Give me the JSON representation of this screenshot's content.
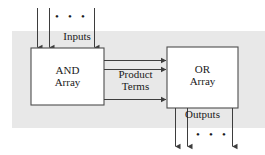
{
  "diagram": {
    "band_color": "#e8e8e8",
    "box_fill": "#ffffff",
    "box_stroke": "#4d4d4d",
    "line_color": "#3d3d3d",
    "text_color": "#1a1a1a",
    "blocks": [
      {
        "id": "and-array",
        "line1": "AND",
        "line2": "Array",
        "x": 31,
        "y": 48,
        "w": 73,
        "h": 57
      },
      {
        "id": "or-array",
        "line1": "OR",
        "line2": "Array",
        "x": 167,
        "y": 47,
        "w": 71,
        "h": 61
      }
    ],
    "labels": {
      "inputs": "Inputs",
      "outputs": "Outputs",
      "product_terms_line1": "Product",
      "product_terms_line2": "Terms",
      "and_line1": "AND",
      "and_line2": "Array",
      "or_line1": "OR",
      "or_line2": "Array",
      "ellipsis": "• • •"
    },
    "signals": {
      "input_arrow_count": 4,
      "product_term_arrow_count": 3,
      "output_arrow_count": 4,
      "input_arrow_x": [
        37,
        49,
        94
      ],
      "input_arrow_extra_x": [
        94
      ],
      "output_arrow_x": [
        175,
        187,
        232
      ],
      "product_arrow_y": [
        60,
        69,
        99
      ]
    }
  }
}
